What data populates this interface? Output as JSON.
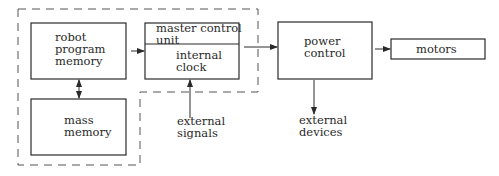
{
  "diagram": {
    "blocks": {
      "robot_program_memory": {
        "label": "robot\nprogram\nmemory"
      },
      "mass_memory": {
        "label": "mass\nmemory"
      },
      "master_control_unit": {
        "label": "master control\nunit"
      },
      "internal_clock": {
        "label": "internal\nclock"
      },
      "power_control": {
        "label": "power\ncontrol"
      },
      "motors": {
        "label": "motors"
      }
    },
    "external_labels": {
      "external_signals": "external\nsignals",
      "external_devices": "external\ndevices"
    },
    "connections": [
      {
        "from": "robot_program_memory",
        "to": "mass_memory",
        "type": "bidirectional"
      },
      {
        "from": "robot_program_memory",
        "to": "master_control_unit",
        "type": "arrow"
      },
      {
        "from": "external_signals",
        "to": "internal_clock",
        "type": "arrow"
      },
      {
        "from": "master_control_unit",
        "to": "power_control",
        "type": "arrow"
      },
      {
        "from": "power_control",
        "to": "motors",
        "type": "arrow"
      },
      {
        "from": "power_control",
        "to": "external_devices",
        "type": "arrow"
      }
    ],
    "colors": {
      "line": "#2a2a2a",
      "background": "#ffffff"
    }
  }
}
